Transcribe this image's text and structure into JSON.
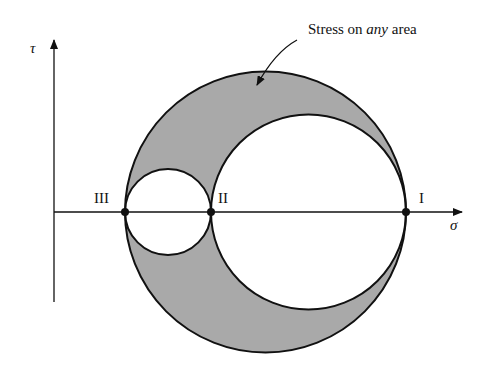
{
  "figure": {
    "annotation": {
      "prefix": "Stress on ",
      "emphasis": "any",
      "suffix": " area"
    },
    "axes": {
      "x_label": "σ",
      "y_label": "τ"
    },
    "points": [
      {
        "id": "III",
        "label": "III"
      },
      {
        "id": "II",
        "label": "II"
      },
      {
        "id": "I",
        "label": "I"
      }
    ],
    "colors": {
      "shade": "#a9a9a9",
      "line": "#111111",
      "background": "#ffffff"
    }
  }
}
